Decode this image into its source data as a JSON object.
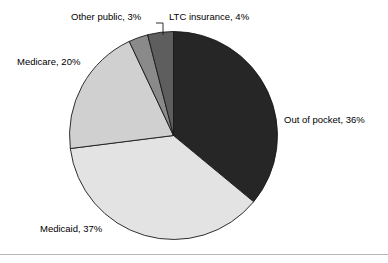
{
  "chart_data": {
    "type": "pie",
    "title": "",
    "categories": [
      "Out of pocket",
      "Medicaid",
      "Medicare",
      "Other public",
      "LTC insurance"
    ],
    "values": [
      36,
      37,
      20,
      3,
      4
    ],
    "unit": "%",
    "labels": [
      "Out of pocket, 36%",
      "Medicaid, 37%",
      "Medicare, 20%",
      "Other public, 3%",
      "LTC insurance, 4%"
    ],
    "colors": [
      "#262626",
      "#e3e3e3",
      "#d0d0d0",
      "#8a8a8a",
      "#5e5e5e"
    ],
    "legend": "none",
    "grid": false,
    "start_angle_deg": 0,
    "direction": "clockwise",
    "slices": [
      {
        "name": "Out of pocket",
        "value": 36,
        "label": "Out of pocket, 36%",
        "color": "#262626"
      },
      {
        "name": "Medicaid",
        "value": 37,
        "label": "Medicaid, 37%",
        "color": "#e3e3e3"
      },
      {
        "name": "Medicare",
        "value": 20,
        "label": "Medicare, 20%",
        "color": "#d0d0d0"
      },
      {
        "name": "Other public",
        "value": 3,
        "label": "Other public, 3%",
        "color": "#8a8a8a"
      },
      {
        "name": "LTC insurance",
        "value": 4,
        "label": "LTC insurance, 4%",
        "color": "#5e5e5e"
      }
    ]
  },
  "labels": {
    "out_of_pocket": "Out of pocket, 36%",
    "medicaid": "Medicaid, 37%",
    "medicare": "Medicare, 20%",
    "other_public": "Other public, 3%",
    "ltc_insurance": "LTC insurance, 4%"
  }
}
